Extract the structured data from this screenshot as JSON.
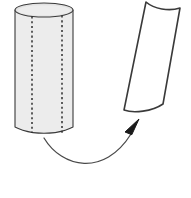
{
  "figure": {
    "name": "cylinder-unrolls-to-flat-sheet-diagram",
    "background_color": "#ffffff",
    "width": 191,
    "height": 198,
    "stroke_color": "#3a3a3a",
    "arrow_color": "#4a4a4a",
    "arrowhead_color": "#1a1a1a",
    "dash_color": "#2e2e2e"
  },
  "cylinder": {
    "label": "cylinder",
    "body_fill": "#ececec",
    "top_face_fill": "#e2e2e2",
    "stroke_color": "#3a3a3a",
    "left_x": 15,
    "right_x": 73,
    "top_y": 3,
    "bottom_y": 130,
    "ellipse_ry": 7,
    "dashed_lines": [
      {
        "label": "perforation-line-left",
        "x": 32
      },
      {
        "label": "perforation-line-right",
        "x": 62
      }
    ]
  },
  "flat_sheet": {
    "label": "unrolled-flat-sheet",
    "fill": "#ffffff",
    "stroke_color": "#3a3a3a",
    "rotation_degrees": -14,
    "corners": {
      "top_left": [
        146,
        2
      ],
      "top_right": [
        180,
        8
      ],
      "bottom_right": [
        163,
        104
      ],
      "bottom_left": [
        124,
        110
      ]
    }
  },
  "arrow": {
    "label": "unroll-transformation-arrow",
    "stroke_color": "#4a4a4a",
    "head_fill": "#1a1a1a",
    "start": [
      44,
      138
    ],
    "control": [
      88,
      176
    ],
    "end": [
      131,
      134
    ],
    "head_tip": [
      139,
      119
    ]
  }
}
